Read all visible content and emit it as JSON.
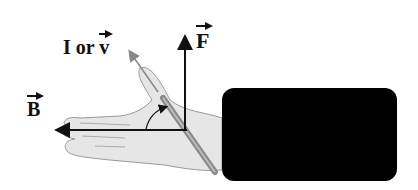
{
  "labels": {
    "force": "F",
    "current_or_velocity_prefix": "I or ",
    "velocity": "v",
    "field": "B"
  },
  "colors": {
    "arrow": "#111111",
    "hand_fill": "#e6e6e6",
    "hand_stroke": "#9a9a9a",
    "rod": "#9a9a9a",
    "redaction": "#000000"
  }
}
